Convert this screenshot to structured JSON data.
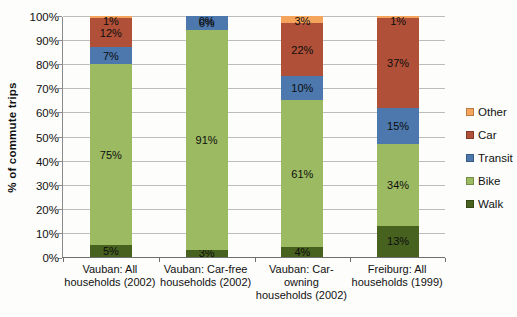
{
  "chart": {
    "y_axis_title": "% of commute trips",
    "y_tick_labels": [
      "0%",
      "10%",
      "20%",
      "30%",
      "40%",
      "50%",
      "60%",
      "70%",
      "80%",
      "90%",
      "100%"
    ],
    "colors": {
      "walk": "#47611f",
      "bike": "#9cba62",
      "transit": "#4c78ae",
      "car": "#b05038",
      "other": "#f5a45b",
      "gridline": "#bdbdbd",
      "axis": "#8a8a8a"
    }
  },
  "chart_data": {
    "type": "bar",
    "stacked": true,
    "orientation": "vertical",
    "title": "",
    "xlabel": "",
    "ylabel": "% of commute trips",
    "ylim": [
      0,
      100
    ],
    "grid": true,
    "value_label_suffix": "%",
    "categories": [
      "Vauban: All\nhouseholds (2002)",
      "Vauban: Car-free\nhouseholds (2002)",
      "Vauban: Car-\nowning\nhouseholds (2002)",
      "Freiburg: All\nhouseholds (1999)"
    ],
    "series": [
      {
        "name": "Walk",
        "color": "#47611f",
        "values": [
          5,
          3,
          4,
          13
        ]
      },
      {
        "name": "Bike",
        "color": "#9cba62",
        "values": [
          75,
          91,
          61,
          34
        ]
      },
      {
        "name": "Transit",
        "color": "#4c78ae",
        "values": [
          7,
          6,
          10,
          15
        ]
      },
      {
        "name": "Car",
        "color": "#b05038",
        "values": [
          12,
          0,
          22,
          37
        ]
      },
      {
        "name": "Other",
        "color": "#f5a45b",
        "values": [
          1,
          0,
          3,
          1
        ]
      }
    ],
    "legend": {
      "position": "right",
      "entries": [
        "Other",
        "Car",
        "Transit",
        "Bike",
        "Walk"
      ]
    }
  }
}
